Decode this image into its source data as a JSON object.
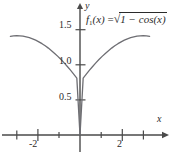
{
  "figure": {
    "background": "#ffffff",
    "curve_color": "#6e6e73",
    "axis_color": "#4a4a4a",
    "text_color": "#2b2b2b"
  },
  "annotation": {
    "function_label": "f1(x) = √(1 − cos(x))",
    "f_letter": "f",
    "f_subscript": "1",
    "f_arg": "(x)",
    "equals": "=",
    "radical_sign": "√",
    "radicand": "1 − cos(x)"
  },
  "axes": {
    "x_name": "x",
    "y_name": "y"
  },
  "chart_data": {
    "type": "line",
    "title": "",
    "subtitle": "",
    "xlabel": "x",
    "ylabel": "y",
    "xlim": [
      -3.45,
      3.45
    ],
    "ylim": [
      0,
      1.65
    ],
    "grid": false,
    "legend": "none",
    "annotations": [
      {
        "text": "f1(x) = √(1 − cos(x))",
        "x": 0.45,
        "y": 1.52
      }
    ],
    "x_ticks": [
      -3,
      -2,
      -1,
      0,
      1,
      2,
      3
    ],
    "x_tick_labels": [
      "",
      "-2",
      "",
      "",
      "",
      "2",
      ""
    ],
    "x_major_ticks": [
      -2,
      2
    ],
    "y_ticks": [
      0.5,
      1.0,
      1.5
    ],
    "y_tick_labels": [
      "0.5",
      "1.0",
      "1.5"
    ],
    "series": [
      {
        "name": "f1(x) = sqrt(1 - cos(x))",
        "color": "#6e6e73",
        "x": [
          -3.3,
          -3.15,
          -3.0,
          -2.85,
          -2.7,
          -2.55,
          -2.4,
          -2.25,
          -2.1,
          -1.95,
          -1.8,
          -1.65,
          -1.5,
          -1.35,
          -1.2,
          -1.05,
          -0.9,
          -0.75,
          -0.6,
          -0.45,
          -0.3,
          -0.15,
          0,
          0.15,
          0.3,
          0.45,
          0.6,
          0.75,
          0.9,
          1.05,
          1.2,
          1.35,
          1.5,
          1.65,
          1.8,
          1.95,
          2.1,
          2.25,
          2.4,
          2.55,
          2.7,
          2.85,
          3.0,
          3.15,
          3.3
        ],
        "y": [
          1.4063,
          1.4121,
          1.4142,
          1.4127,
          1.4075,
          1.3986,
          1.3861,
          1.3701,
          1.3504,
          1.3273,
          1.3008,
          1.2709,
          1.2378,
          1.2015,
          1.1621,
          1.1198,
          1.0746,
          1.0266,
          0.9761,
          0.9231,
          0.8678,
          0.8104,
          0.0,
          0.8104,
          0.8678,
          0.9231,
          0.9761,
          1.0266,
          1.0746,
          1.1198,
          1.1621,
          1.2015,
          1.2378,
          1.2709,
          1.3008,
          1.3273,
          1.3504,
          1.3701,
          1.3861,
          1.3986,
          1.4075,
          1.4127,
          1.4142,
          1.4121,
          1.4063
        ]
      }
    ]
  }
}
